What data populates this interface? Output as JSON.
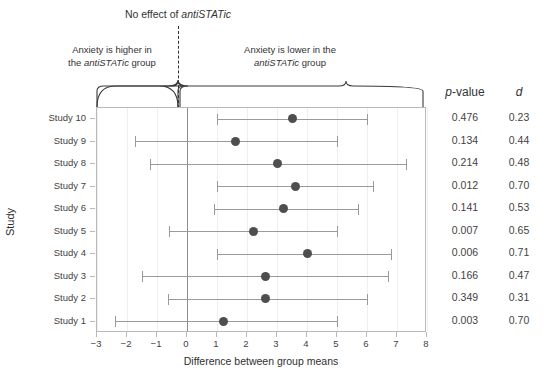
{
  "title": {
    "prefix": "No effect of ",
    "italic": "antiSTATic"
  },
  "annotations": {
    "left": {
      "line1": "Anxiety is higher in",
      "line2_pre": "the ",
      "line2_italic": "antiSTATic",
      "line2_post": " group"
    },
    "right": {
      "line1": "Anxiety is lower in the",
      "line2_italic": "antiSTATic",
      "line2_post": " group"
    }
  },
  "axes": {
    "x_title": "Difference between group means",
    "y_title": "Study",
    "x_ticks": [
      "-3",
      "-2",
      "-1",
      "0",
      "1",
      "2",
      "3",
      "4",
      "5",
      "6",
      "7",
      "8"
    ],
    "x_min": -3,
    "x_max": 8
  },
  "columns": {
    "p_prefix": "p",
    "p_suffix": "-value",
    "d_header": "d"
  },
  "colors": {
    "dot": "#4e4e4e",
    "line": "#9a9a9a",
    "zero": "#8d8d8d",
    "panel_border": "#b9b9b9"
  },
  "chart_data": {
    "type": "scatter",
    "title": "No effect of antiSTATic",
    "xlabel": "Difference between group means",
    "ylabel": "Study",
    "xlim": [
      -3,
      8
    ],
    "grid": true,
    "legend": "none",
    "reference_line": 0,
    "categories": [
      "Study 10",
      "Study 9",
      "Study 8",
      "Study 7",
      "Study 6",
      "Study 5",
      "Study 4",
      "Study 3",
      "Study 2",
      "Study 1"
    ],
    "rows": [
      {
        "study": "Study 10",
        "estimate": 3.5,
        "ci_low": 1.0,
        "ci_high": 6.0,
        "p": "0.476",
        "d": "0.23"
      },
      {
        "study": "Study 9",
        "estimate": 1.6,
        "ci_low": -1.75,
        "ci_high": 5.0,
        "p": "0.134",
        "d": "0.44"
      },
      {
        "study": "Study 8",
        "estimate": 3.0,
        "ci_low": -1.25,
        "ci_high": 7.3,
        "p": "0.214",
        "d": "0.48"
      },
      {
        "study": "Study 7",
        "estimate": 3.6,
        "ci_low": 1.0,
        "ci_high": 6.2,
        "p": "0.012",
        "d": "0.70"
      },
      {
        "study": "Study 6",
        "estimate": 3.2,
        "ci_low": 0.9,
        "ci_high": 5.7,
        "p": "0.141",
        "d": "0.53"
      },
      {
        "study": "Study 5",
        "estimate": 2.2,
        "ci_low": -0.6,
        "ci_high": 5.0,
        "p": "0.007",
        "d": "0.65"
      },
      {
        "study": "Study 4",
        "estimate": 4.0,
        "ci_low": 1.0,
        "ci_high": 6.8,
        "p": "0.006",
        "d": "0.71"
      },
      {
        "study": "Study 3",
        "estimate": 2.6,
        "ci_low": -1.5,
        "ci_high": 6.7,
        "p": "0.166",
        "d": "0.47"
      },
      {
        "study": "Study 2",
        "estimate": 2.6,
        "ci_low": -0.65,
        "ci_high": 6.0,
        "p": "0.349",
        "d": "0.31"
      },
      {
        "study": "Study 1",
        "estimate": 1.2,
        "ci_low": -2.4,
        "ci_high": 5.0,
        "p": "0.003",
        "d": "0.70"
      }
    ]
  }
}
